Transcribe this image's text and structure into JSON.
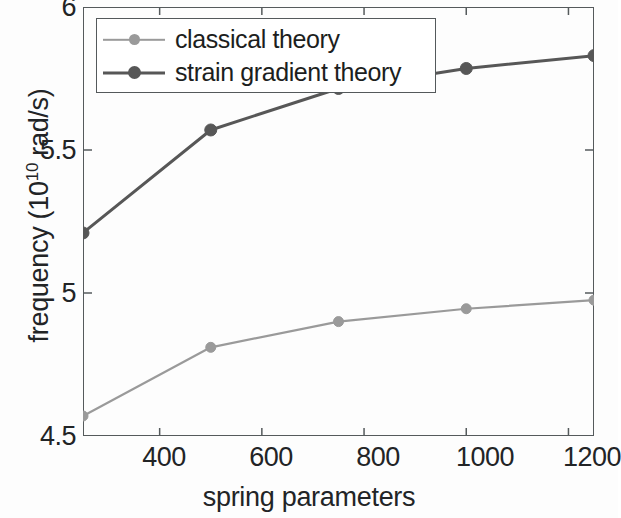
{
  "chart_data": {
    "type": "line",
    "title": "",
    "xlabel": "spring parameters",
    "ylabel": "frequency (10^10 rad/s)",
    "ylabel_base": "frequency (10",
    "ylabel_exp": "10",
    "ylabel_tail": " rad/s)",
    "xlim": [
      250,
      1250
    ],
    "ylim": [
      4.5,
      6
    ],
    "xticks": [
      400,
      600,
      800,
      1000,
      1200
    ],
    "yticks": [
      4.5,
      5,
      5.5,
      6
    ],
    "xtick_labels": [
      "400",
      "600",
      "800",
      "1000",
      "1200"
    ],
    "ytick_labels": [
      "4.5",
      "5",
      "5.5",
      "6"
    ],
    "grid": false,
    "legend_position": "upper left inside",
    "x": [
      250,
      500,
      750,
      1000,
      1250
    ],
    "series": [
      {
        "name": "classical theory",
        "color": "#9a9a9a",
        "marker": "circle",
        "values": [
          4.57,
          4.81,
          4.9,
          4.945,
          4.975
        ]
      },
      {
        "name": "strain gradient theory",
        "color": "#575757",
        "marker": "circle",
        "values": [
          5.21,
          5.57,
          5.715,
          5.785,
          5.83
        ]
      }
    ]
  },
  "legend": {
    "items": [
      {
        "label": "classical theory"
      },
      {
        "label": "strain gradient theory"
      }
    ]
  },
  "axes": {
    "frame_color": "#555a5c"
  }
}
